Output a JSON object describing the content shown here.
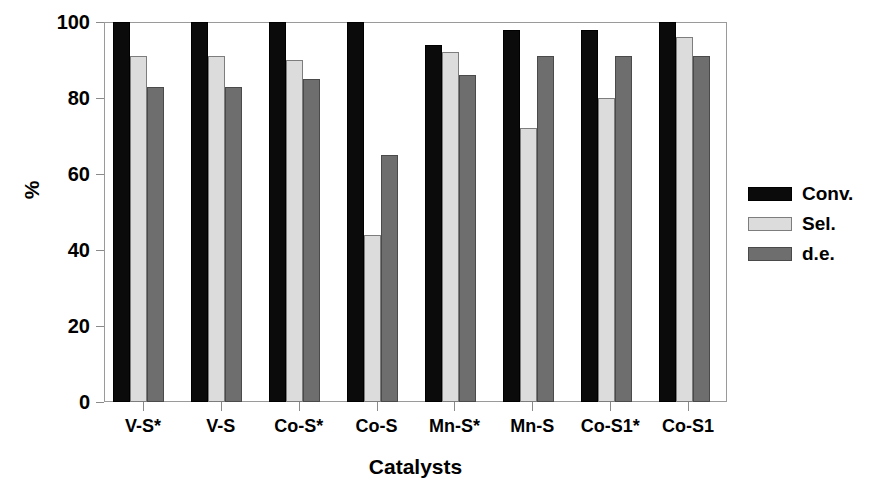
{
  "chart_data": {
    "type": "bar",
    "title": "",
    "xlabel": "Catalysts",
    "ylabel": "%",
    "ylim": [
      0,
      100
    ],
    "yticks": [
      0,
      20,
      40,
      60,
      80,
      100
    ],
    "ytick_labels": [
      "0",
      "20",
      "40",
      "60",
      "80",
      "100"
    ],
    "grid": false,
    "legend_position": "right",
    "categories": [
      "V-S*",
      "V-S",
      "Co-S*",
      "Co-S",
      "Mn-S*",
      "Mn-S",
      "Co-S1*",
      "Co-S1"
    ],
    "series": [
      {
        "name": "Conv.",
        "color": "#0b0b0b",
        "values": [
          100,
          100,
          100,
          100,
          94,
          98,
          98,
          100
        ]
      },
      {
        "name": "Sel.",
        "color": "#dcdcdc",
        "values": [
          91,
          91,
          90,
          44,
          92,
          72,
          80,
          96
        ]
      },
      {
        "name": "d.e.",
        "color": "#6e6e6e",
        "values": [
          83,
          83,
          85,
          65,
          86,
          91,
          91,
          91
        ]
      }
    ]
  },
  "legend": {
    "items": [
      {
        "label": "Conv.",
        "swatch": "black-swatch"
      },
      {
        "label": "Sel.",
        "swatch": "light-gray-swatch"
      },
      {
        "label": "d.e.",
        "swatch": "dark-gray-swatch"
      }
    ]
  }
}
